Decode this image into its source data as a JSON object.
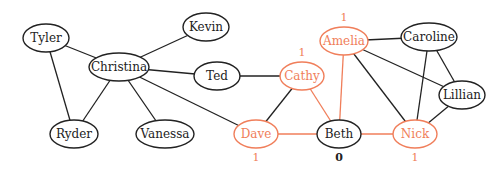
{
  "colors": {
    "highlight": "#f07e5a",
    "default": "#222222"
  },
  "nodes": [
    {
      "id": "tyler",
      "label": "Tyler",
      "x": 46,
      "y": 38,
      "rx": 23,
      "ry": 14,
      "hl": false
    },
    {
      "id": "kevin",
      "label": "Kevin",
      "x": 206,
      "y": 27,
      "rx": 23,
      "ry": 14,
      "hl": false
    },
    {
      "id": "christina",
      "label": "Christina",
      "x": 119,
      "y": 67,
      "rx": 30,
      "ry": 14,
      "hl": false
    },
    {
      "id": "ted",
      "label": "Ted",
      "x": 217,
      "y": 76,
      "rx": 23,
      "ry": 14,
      "hl": false
    },
    {
      "id": "ryder",
      "label": "Ryder",
      "x": 74,
      "y": 134,
      "rx": 24,
      "ry": 14,
      "hl": false
    },
    {
      "id": "vanessa",
      "label": "Vanessa",
      "x": 165,
      "y": 134,
      "rx": 29,
      "ry": 14,
      "hl": false
    },
    {
      "id": "amelia",
      "label": "Amelia",
      "x": 344,
      "y": 41,
      "rx": 24,
      "ry": 14,
      "hl": true,
      "count": "1"
    },
    {
      "id": "caroline",
      "label": "Caroline",
      "x": 429,
      "y": 37,
      "rx": 28,
      "ry": 14,
      "hl": false
    },
    {
      "id": "cathy",
      "label": "Cathy",
      "x": 302,
      "y": 76,
      "rx": 22,
      "ry": 14,
      "hl": true,
      "count": "1"
    },
    {
      "id": "lillian",
      "label": "Lillian",
      "x": 462,
      "y": 95,
      "rx": 23,
      "ry": 14,
      "hl": false
    },
    {
      "id": "dave",
      "label": "Dave",
      "x": 256,
      "y": 134,
      "rx": 22,
      "ry": 14,
      "hl": true,
      "count": "1"
    },
    {
      "id": "beth",
      "label": "Beth",
      "x": 339,
      "y": 134,
      "rx": 22,
      "ry": 14,
      "hl": false,
      "count": "0"
    },
    {
      "id": "nick",
      "label": "Nick",
      "x": 415,
      "y": 134,
      "rx": 22,
      "ry": 14,
      "hl": true,
      "count": "1"
    }
  ],
  "edges": [
    [
      "tyler",
      "christina",
      false
    ],
    [
      "tyler",
      "ryder",
      false
    ],
    [
      "christina",
      "kevin",
      false
    ],
    [
      "christina",
      "ted",
      false
    ],
    [
      "christina",
      "ryder",
      false
    ],
    [
      "christina",
      "vanessa",
      false
    ],
    [
      "christina",
      "dave",
      false
    ],
    [
      "ted",
      "cathy",
      false
    ],
    [
      "cathy",
      "dave",
      false
    ],
    [
      "cathy",
      "beth",
      true
    ],
    [
      "dave",
      "beth",
      true
    ],
    [
      "beth",
      "amelia",
      true
    ],
    [
      "beth",
      "nick",
      true
    ],
    [
      "amelia",
      "caroline",
      false
    ],
    [
      "amelia",
      "lillian",
      false
    ],
    [
      "amelia",
      "nick",
      false
    ],
    [
      "caroline",
      "nick",
      false
    ],
    [
      "caroline",
      "lillian",
      false
    ],
    [
      "lillian",
      "nick",
      false
    ]
  ]
}
